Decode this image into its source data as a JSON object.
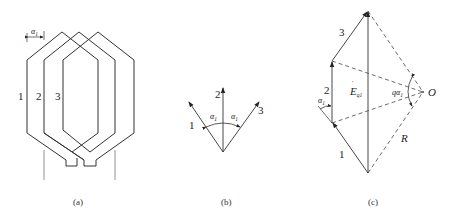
{
  "figure": {
    "panels": [
      {
        "id": "a",
        "caption": "(a)",
        "description": "Three overlapping hexagonal coils offset by slot angle",
        "coil_labels": [
          "1",
          "2",
          "3"
        ],
        "angle_label": "α",
        "angle_subscript": "1"
      },
      {
        "id": "b",
        "caption": "(b)",
        "description": "Three EMF phasors separated by slot angle",
        "phasor_labels": [
          "1",
          "2",
          "3"
        ],
        "angle_labels": [
          {
            "symbol": "α",
            "subscript": "1"
          },
          {
            "symbol": "α",
            "subscript": "1"
          }
        ]
      },
      {
        "id": "c",
        "caption": "(c)",
        "description": "Phasor sum of coil-group EMF inscribed in circle of radius R",
        "phasor_labels": [
          "1",
          "2",
          "3"
        ],
        "resultant_label": "E",
        "resultant_subscript": "q1",
        "center_label": "O",
        "radius_label": "R",
        "central_angle_label": "qα",
        "central_angle_subscript": "1",
        "slot_angle_label": "α",
        "slot_angle_subscript": "1"
      }
    ]
  }
}
